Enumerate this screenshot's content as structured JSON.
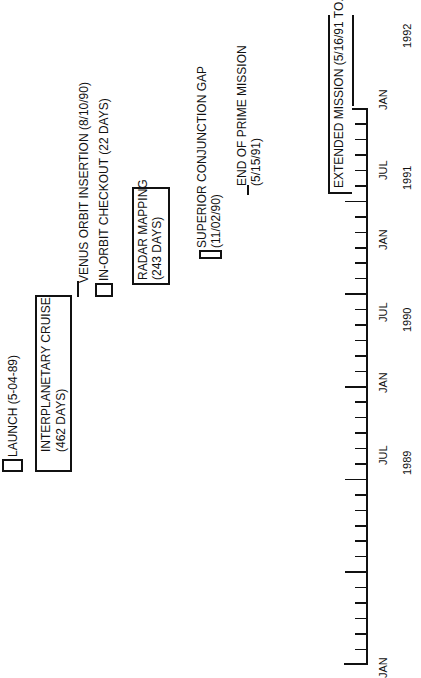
{
  "events": {
    "launch": {
      "label": "LAUNCH (5-04-89)"
    },
    "cruise": {
      "line1": "INTERPLANETARY CRUISE",
      "line2": "(462 DAYS)"
    },
    "voi": {
      "label": "VENUS ORBIT INSERTION (8/10/90)"
    },
    "checkout": {
      "label": "IN-ORBIT CHECKOUT (22 DAYS)"
    },
    "radar": {
      "line1": "RADAR MAPPING",
      "line2": "(243 DAYS)"
    },
    "scg": {
      "line1": "SUPERIOR CONJUNCTION GAP",
      "line2": "(11/02/90)"
    },
    "end_prime": {
      "line1": "END OF PRIME MISSION",
      "line2": "(5/15/91)"
    },
    "extended": {
      "label": "EXTENDED MISSION (5/16/91 TO...)"
    }
  },
  "axis": {
    "months": [
      "JAN",
      "JUL",
      "JAN",
      "JUL",
      "JAN",
      "JUL",
      "JAN"
    ],
    "years": [
      "1989",
      "1990",
      "1991",
      "1992"
    ]
  },
  "chart_data": {
    "type": "timeline",
    "title": "",
    "axis_range": [
      "JAN 1989",
      "JAN 1992"
    ],
    "tick_interval": "month",
    "items": [
      {
        "name": "LAUNCH",
        "date": "5-04-89",
        "kind": "milestone"
      },
      {
        "name": "INTERPLANETARY CRUISE",
        "duration_days": 462,
        "kind": "phase"
      },
      {
        "name": "VENUS ORBIT INSERTION",
        "date": "8/10/90",
        "kind": "milestone"
      },
      {
        "name": "IN-ORBIT CHECKOUT",
        "duration_days": 22,
        "kind": "phase"
      },
      {
        "name": "RADAR MAPPING",
        "duration_days": 243,
        "kind": "phase"
      },
      {
        "name": "SUPERIOR CONJUNCTION GAP",
        "date": "11/02/90",
        "kind": "phase"
      },
      {
        "name": "END OF PRIME MISSION",
        "date": "5/15/91",
        "kind": "milestone"
      },
      {
        "name": "EXTENDED MISSION",
        "start": "5/16/91",
        "end": "ongoing",
        "kind": "phase"
      }
    ]
  }
}
